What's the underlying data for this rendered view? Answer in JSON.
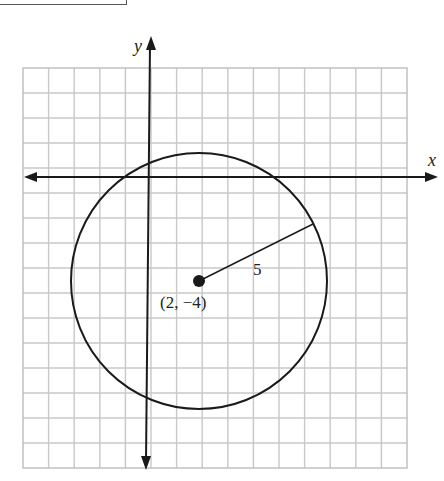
{
  "diagram": {
    "type": "coordinate-plane-circle",
    "axes": {
      "x_label": "x",
      "y_label": "y"
    },
    "grid": {
      "columns": 15,
      "rows": 16,
      "unit_px": 25.5
    },
    "circle": {
      "center": [
        2,
        -4
      ],
      "radius": 5
    },
    "center_label": "(2, −4)",
    "radius_label": "5",
    "colors": {
      "grid": "#c8c8c8",
      "ink": "#1a1a1a"
    }
  }
}
